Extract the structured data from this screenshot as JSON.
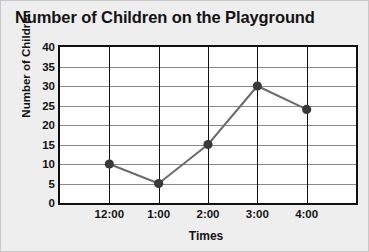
{
  "chart_data": {
    "type": "line",
    "title": "Number of Children on the Playground",
    "xlabel": "Times",
    "ylabel": "Number of Children",
    "categories": [
      "12:00",
      "1:00",
      "2:00",
      "3:00",
      "4:00"
    ],
    "values": [
      10,
      5,
      15,
      30,
      24
    ],
    "ylim": [
      0,
      40
    ],
    "ytick_values": [
      0,
      5,
      10,
      15,
      20,
      25,
      30,
      35,
      40
    ],
    "ytick_labels": [
      "0",
      "5",
      "10",
      "15",
      "20",
      "25",
      "30",
      "35",
      "40"
    ],
    "grid": true,
    "legend": false,
    "marker": "circle",
    "line_color": "#6b6b6b",
    "marker_color": "#3a3a3a",
    "gridline_color": "#8a8a8a",
    "axis_color": "#111111",
    "background_color": "#eeeeee",
    "plot_background_color": "#ffffff"
  }
}
